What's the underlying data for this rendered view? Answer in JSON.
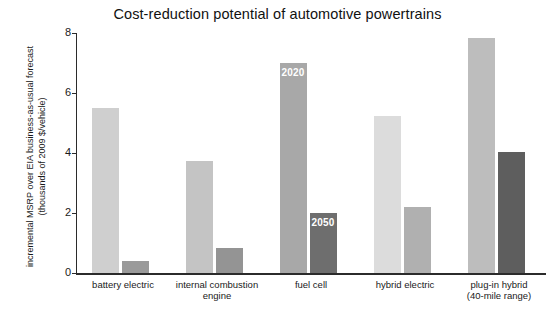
{
  "chart_data": {
    "type": "bar",
    "title": "Cost-reduction potential of automotive powertrains",
    "xlabel": "",
    "ylabel_line1": "incremental MSRP over EIA business-as-usual forecast",
    "ylabel_line2": "(thousands of 2009 $/vehicle)",
    "ylim": [
      0,
      8
    ],
    "yticks": [
      "0",
      "2",
      "4",
      "6",
      "8"
    ],
    "ytick_values": [
      0,
      2,
      4,
      6,
      8
    ],
    "grid": false,
    "legend": "none",
    "annotations": [
      {
        "text": "2020",
        "series": "2020",
        "category": "fuel cell"
      },
      {
        "text": "2050",
        "series": "2050",
        "category": "fuel cell"
      }
    ],
    "categories": [
      {
        "line1": "battery electric",
        "line2": ""
      },
      {
        "line1": "internal combustion",
        "line2": "engine"
      },
      {
        "line1": "fuel cell",
        "line2": ""
      },
      {
        "line1": "hybrid electric",
        "line2": ""
      },
      {
        "line1": "plug-in hybrid",
        "line2": "(40-mile range)"
      }
    ],
    "series": [
      {
        "name": "2020",
        "values": [
          5.5,
          3.75,
          7.0,
          5.25,
          7.85
        ],
        "colors": [
          "#cfcfcf",
          "#c4c4c4",
          "#a8a8a8",
          "#dcdcdc",
          "#bdbdbd"
        ]
      },
      {
        "name": "2050",
        "values": [
          0.4,
          0.85,
          2.0,
          2.2,
          4.05
        ],
        "colors": [
          "#9a9a9a",
          "#949494",
          "#6e6e6e",
          "#b0b0b0",
          "#5e5e5e"
        ]
      }
    ]
  }
}
